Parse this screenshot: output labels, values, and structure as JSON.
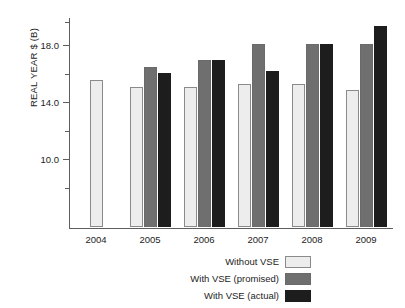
{
  "chart_data": {
    "type": "bar",
    "title": "",
    "subtitle": "",
    "xlabel": "",
    "ylabel": "REAL YEAR $ (B)",
    "categories": [
      "2004",
      "2005",
      "2006",
      "2007",
      "2008",
      "2009"
    ],
    "series": [
      {
        "name": "Without VSE",
        "color": "#ededed",
        "values": [
          15.5,
          15.0,
          15.0,
          15.2,
          15.2,
          14.8
        ]
      },
      {
        "name": "With VSE (promised)",
        "color": "#6f6f6f",
        "values": [
          null,
          16.4,
          16.9,
          18.0,
          18.0,
          18.0
        ]
      },
      {
        "name": "With VSE (actual)",
        "color": "#1d1d1d",
        "values": [
          null,
          16.0,
          16.9,
          16.1,
          18.0,
          19.3
        ]
      }
    ],
    "ylim": [
      5.2,
      19.9
    ],
    "yticks": [
      10.0,
      14.0,
      18.0
    ],
    "ytick_labels": [
      "10.0",
      "14.0",
      "18.0"
    ],
    "yminor_ticks": [
      8.0,
      12.0,
      16.0,
      19.6
    ],
    "grid": false,
    "legend_position": "bottom-center",
    "axis_color": "#5d5d5d"
  },
  "legend": {
    "items": [
      {
        "label": "Without VSE",
        "swatch": "series-0-swatch"
      },
      {
        "label": "With VSE (promised)",
        "swatch": "series-1-swatch"
      },
      {
        "label": "With VSE (actual)",
        "swatch": "series-2-swatch"
      }
    ]
  }
}
